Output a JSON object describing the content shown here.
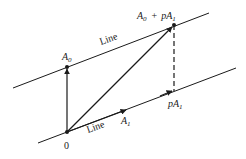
{
  "diagram": {
    "type": "vector-geometry",
    "colors": {
      "ink": "#1a1a1a",
      "background": "#ffffff"
    },
    "lines": [
      {
        "id": "top-line",
        "label": "Line",
        "from": [
          13,
          88
        ],
        "to": [
          209,
          13
        ]
      },
      {
        "id": "bottom-line",
        "label": "Line",
        "from": [
          38,
          143
        ],
        "to": [
          236,
          68
        ]
      }
    ],
    "points": {
      "origin": {
        "label": "0",
        "xy": [
          67,
          132
        ]
      },
      "A0": {
        "label_main": "A",
        "label_sub": "0",
        "xy": [
          67,
          67
        ]
      },
      "A0_plus_pA1": {
        "label_main_1": "A",
        "label_sub_1": "0",
        "label_plus": "+",
        "label_p": "p",
        "label_main_2": "A",
        "label_sub_2": "1",
        "xy": [
          174,
          25
        ]
      },
      "pA1": {
        "label_p": "p",
        "label_main": "A",
        "label_sub": "1",
        "xy": [
          172,
          91
        ]
      },
      "A1": {
        "label_main": "A",
        "label_sub": "1",
        "xy": [
          124,
          110
        ]
      }
    },
    "labels": {
      "top_line": "Line",
      "bottom_line": "Line"
    }
  }
}
